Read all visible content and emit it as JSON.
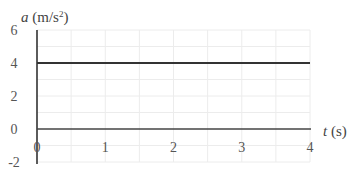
{
  "chart_data": {
    "type": "line",
    "title": "",
    "xlabel": "t (s)",
    "ylabel": "a (m/s²)",
    "xlabel_var": "t",
    "xlabel_unit": "(s)",
    "ylabel_var": "a",
    "ylabel_unit": "(m/s",
    "ylabel_sup": "2",
    "ylabel_close": ")",
    "xlim": [
      0,
      4
    ],
    "ylim": [
      -2,
      6
    ],
    "x_ticks": [
      1,
      2,
      3,
      4
    ],
    "x_tick_labels": [
      "1",
      "2",
      "3",
      "4"
    ],
    "y_ticks": [
      6,
      4,
      2,
      0,
      -2
    ],
    "y_tick_labels": [
      "6",
      "4",
      "2",
      "0",
      "-2"
    ],
    "origin_label": "0",
    "grid": true,
    "grid_step_x": 0.5,
    "grid_step_y": 1,
    "legend": null,
    "series": [
      {
        "name": "acceleration",
        "x": [
          0,
          4
        ],
        "y": [
          4,
          4
        ],
        "color": "#333333"
      }
    ]
  }
}
